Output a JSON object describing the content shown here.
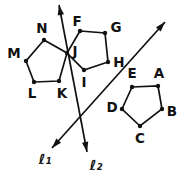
{
  "figure": {
    "canvas": {
      "width": 185,
      "height": 176,
      "background": "#ffffff",
      "ink": "#111111"
    },
    "pentagons": [
      {
        "name": "pentagon-MNJKL",
        "vertices": [
          {
            "label": "N",
            "x": 44,
            "y": 40,
            "lx": 42,
            "ly": 28
          },
          {
            "label": "J",
            "x": 67,
            "y": 53,
            "lx": 75,
            "ly": 51
          },
          {
            "label": "K",
            "x": 59,
            "y": 81,
            "lx": 62,
            "ly": 93
          },
          {
            "label": "L",
            "x": 34,
            "y": 82,
            "lx": 32,
            "ly": 93
          },
          {
            "label": "M",
            "x": 26,
            "y": 61,
            "lx": 14,
            "ly": 53
          }
        ]
      },
      {
        "name": "pentagon-FGHIJ",
        "vertices": [
          {
            "label": "F",
            "x": 80,
            "y": 31,
            "lx": 77,
            "ly": 21
          },
          {
            "label": "G",
            "x": 105,
            "y": 33,
            "lx": 116,
            "ly": 27
          },
          {
            "label": "H",
            "x": 108,
            "y": 62,
            "lx": 119,
            "ly": 62
          },
          {
            "label": "I",
            "x": 84,
            "y": 70,
            "lx": 84,
            "ly": 82
          },
          {
            "label": "J",
            "x": 67,
            "y": 53,
            "lx": 75,
            "ly": 51,
            "dup": true
          }
        ]
      },
      {
        "name": "pentagon-ABCDE",
        "vertices": [
          {
            "label": "E",
            "x": 132,
            "y": 87,
            "lx": 132,
            "ly": 73
          },
          {
            "label": "A",
            "x": 158,
            "y": 86,
            "lx": 159,
            "ly": 73
          },
          {
            "label": "B",
            "x": 162,
            "y": 109,
            "lx": 172,
            "ly": 111
          },
          {
            "label": "C",
            "x": 140,
            "y": 126,
            "lx": 140,
            "ly": 138
          },
          {
            "label": "D",
            "x": 122,
            "y": 109,
            "lx": 112,
            "ly": 107
          }
        ]
      }
    ],
    "lines": [
      {
        "name": "l1",
        "label": "ℓ₁",
        "x1": 52,
        "y1": 148,
        "x2": 165,
        "y2": 22,
        "lx": 45,
        "ly": 159
      },
      {
        "name": "l2",
        "label": "ℓ₂",
        "x1": 59,
        "y1": 5,
        "x2": 87,
        "y2": 152,
        "lx": 96,
        "ly": 165
      }
    ],
    "style": {
      "stroke_width": 1.7,
      "dot_radius": 2.2,
      "arrow_length": 10,
      "arrow_half_width": 3.2
    }
  }
}
